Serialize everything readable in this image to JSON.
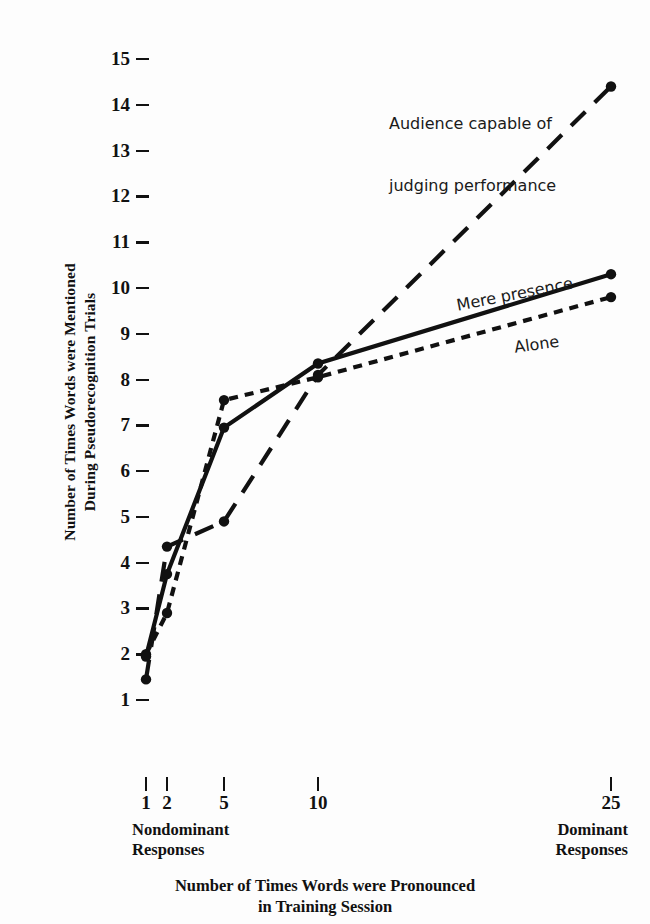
{
  "chart_data": {
    "type": "line",
    "title": "",
    "xlabel": "Number of Times Words were Pronounced in Training Session",
    "ylabel": "Number of Times Words were Mentioned During Pseudorecognition Trials",
    "x": [
      1,
      2,
      5,
      10,
      25
    ],
    "xtick_labels": [
      "1",
      "2",
      "5",
      "10",
      "25"
    ],
    "xscale": "log-like (unevenly spaced categorical)",
    "ytick_labels": [
      "15",
      "14",
      "13",
      "12",
      "11",
      "10",
      "9",
      "8",
      "7",
      "6",
      "5",
      "4",
      "3",
      "2",
      "1"
    ],
    "ylim": [
      1,
      15
    ],
    "grid": false,
    "legend_position": "inline annotations at curve ends",
    "x_axis_left_group": "Nondominant Responses",
    "x_axis_right_group": "Dominant Responses",
    "series": [
      {
        "name": "Alone",
        "style": "short-dashed",
        "values": [
          2.0,
          2.9,
          7.55,
          8.05,
          9.8
        ]
      },
      {
        "name": "Mere presence",
        "style": "solid",
        "values": [
          1.95,
          3.75,
          6.95,
          8.35,
          10.3
        ]
      },
      {
        "name": "Audience capable of judging performance",
        "style": "long-dashed",
        "values": [
          1.45,
          4.35,
          4.9,
          8.1,
          14.4
        ]
      }
    ],
    "annotations": [
      {
        "text": "Audience capable of\njudging performance",
        "series": "Audience capable of judging performance"
      },
      {
        "text": "Mere presence",
        "series": "Mere presence"
      },
      {
        "text": "Alone",
        "series": "Alone"
      }
    ]
  },
  "axes": {
    "y_title_line1": "Number of Times Words were Mentioned",
    "y_title_line2": "During Pseudorecognition Trials",
    "x_title_line1": "Number of Times Words were Pronounced",
    "x_title_line2": "in Training Session",
    "left_group_line1": "Nondominant",
    "left_group_line2": "Responses",
    "right_group_line1": "Dominant",
    "right_group_line2": "Responses"
  },
  "annotations": {
    "audience_line1": "Audience capable of",
    "audience_line2": "judging performance",
    "mere_presence": "Mere presence",
    "alone": "Alone"
  },
  "colors": {
    "ink": "#111111",
    "background": "#fdfdfd"
  }
}
